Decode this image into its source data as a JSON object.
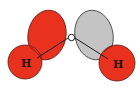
{
  "diagram": {
    "atoms": {
      "oxygen": {
        "label": "O"
      },
      "hydrogen_left": {
        "label": "H"
      },
      "hydrogen_right": {
        "label": "H"
      }
    },
    "lobes": [
      {
        "name": "left-lone-pair-lobe",
        "color": "#e8321e"
      },
      {
        "name": "right-lone-pair-lobe",
        "color": "#c4c4c4"
      }
    ],
    "colors": {
      "red": "#e8321e",
      "gray": "#c4c4c4",
      "outline": "#3a1a14",
      "bond": "#1a1a1a"
    }
  }
}
